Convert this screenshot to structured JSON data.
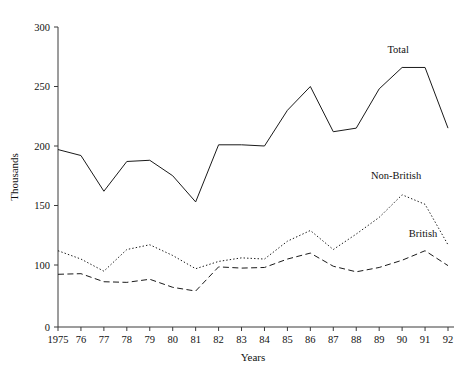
{
  "chart_data": {
    "type": "line",
    "title": "",
    "xlabel": "Years",
    "ylabel": "Thousands",
    "grid": false,
    "legend_position": "inline-end-labels",
    "x": [
      "1975",
      "76",
      "77",
      "78",
      "79",
      "80",
      "81",
      "82",
      "83",
      "84",
      "85",
      "86",
      "87",
      "88",
      "89",
      "90",
      "91",
      "92"
    ],
    "x_tick_labels": [
      "1975",
      "76",
      "77",
      "78",
      "79",
      "80",
      "81",
      "82",
      "83",
      "84",
      "85",
      "86",
      "87",
      "88",
      "89",
      "90",
      "91",
      "92"
    ],
    "y_tick_labels": [
      "300",
      "250",
      "200",
      "150",
      "100",
      "0"
    ],
    "y_tick_values": [
      300,
      250,
      200,
      150,
      100,
      0
    ],
    "ylim": [
      0,
      300
    ],
    "series": [
      {
        "name": "Total",
        "style": "solid",
        "color": "#1a1a1a",
        "values": [
          197,
          192,
          162,
          187,
          188,
          175,
          153,
          201,
          201,
          200,
          230,
          250,
          212,
          215,
          248,
          266,
          266,
          215
        ]
      },
      {
        "name": "Non-British",
        "style": "dotted",
        "color": "#1a1a1a",
        "values": [
          112,
          105,
          90,
          113,
          117,
          108,
          94,
          103,
          106,
          105,
          120,
          129,
          113,
          126,
          140,
          159,
          151,
          117
        ]
      },
      {
        "name": "British",
        "style": "dashed",
        "color": "#1a1a1a",
        "values": [
          85,
          86,
          73,
          72,
          77,
          64,
          58,
          97,
          95,
          96,
          105,
          110,
          98,
          89,
          96,
          104,
          112,
          99
        ]
      }
    ],
    "annotations": [
      {
        "text": "Total",
        "series": "Total"
      },
      {
        "text": "Non-British",
        "series": "Non-British"
      },
      {
        "text": "British",
        "series": "British"
      }
    ]
  }
}
